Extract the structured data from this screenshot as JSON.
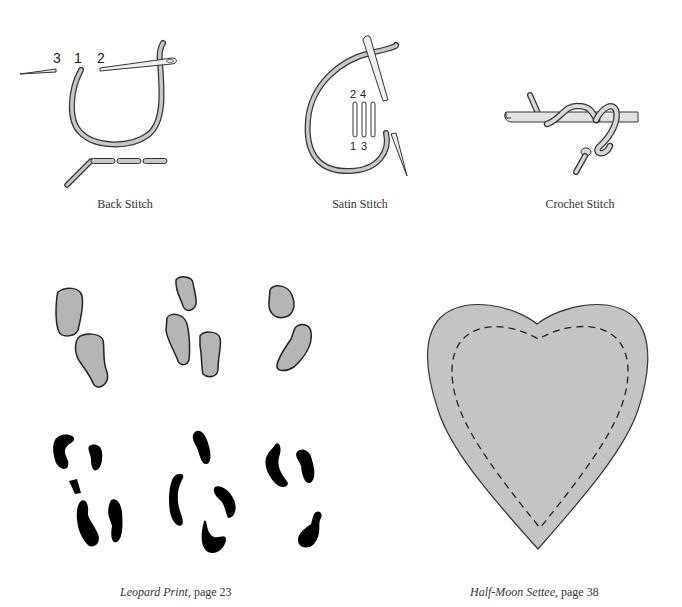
{
  "illustrations": {
    "back_stitch": {
      "caption": "Back Stitch",
      "labels": [
        "3",
        "1",
        "2"
      ]
    },
    "satin_stitch": {
      "caption": "Satin Stitch",
      "labels_top": [
        "2",
        "4"
      ],
      "labels_bottom": [
        "1",
        "3"
      ]
    },
    "crochet_stitch": {
      "caption": "Crochet Stitch"
    },
    "leopard_print": {
      "caption_title": "Leopard Print",
      "caption_rest": ", page 23"
    },
    "half_moon_settee": {
      "caption_title": "Half-Moon Settee",
      "caption_rest": ", page 38"
    }
  },
  "colors": {
    "thread_fill": "#c8c8c8",
    "outline": "#333333",
    "spot_gray": "#b5b5b5",
    "spot_black": "#000000",
    "heart_fill": "#c4c4c4"
  }
}
